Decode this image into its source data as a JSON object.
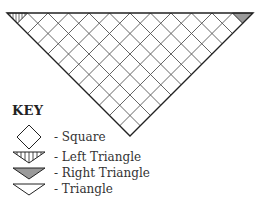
{
  "diagram": {
    "type": "triangular shawl chart",
    "shape": "inverted triangle",
    "colors": {
      "line": "#222222",
      "grid": "#555555",
      "fill_right_triangle": "#9a9a9a",
      "background": "#ffffff"
    },
    "grid_units_across_top": 12
  },
  "key": {
    "title": "KEY",
    "items": [
      {
        "icon": "square-diamond-icon",
        "label": "- Square"
      },
      {
        "icon": "left-triangle-hatched-icon",
        "label": "- Left Triangle"
      },
      {
        "icon": "right-triangle-filled-icon",
        "label": "- Right Triangle"
      },
      {
        "icon": "triangle-outline-icon",
        "label": "- Triangle"
      }
    ]
  }
}
